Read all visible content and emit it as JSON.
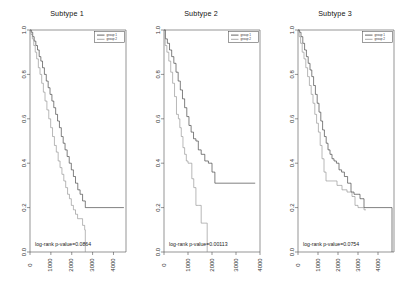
{
  "figure": {
    "background": "#ffffff",
    "panel_count": 3
  },
  "axes": {
    "x_ticks": [
      "0",
      "1000",
      "2000",
      "3000",
      "4000"
    ],
    "x_tick_values": [
      0,
      1000,
      2000,
      3000,
      4000
    ],
    "y_ticks": [
      "0.0",
      "0.2",
      "0.4",
      "0.6",
      "0.8",
      "1.0"
    ],
    "y_tick_values": [
      0.0,
      0.2,
      0.4,
      0.6,
      0.8,
      1.0
    ],
    "xlabel": "",
    "ylabel": ""
  },
  "legend": {
    "position": "top-right",
    "entries": [
      {
        "label": "group 1",
        "color": "#333333"
      },
      {
        "label": "group 2",
        "color": "#8c8c8c"
      }
    ]
  },
  "panels": [
    {
      "title": "Subtype 1",
      "pvalue_text": "log-rank p-value=0.0864",
      "xlim": [
        0,
        4600
      ],
      "ylim": [
        0,
        1
      ]
    },
    {
      "title": "Subtype 2",
      "pvalue_text": "log-rank p-value=0.00113",
      "xlim": [
        0,
        4000
      ],
      "ylim": [
        0,
        1
      ]
    },
    {
      "title": "Subtype 3",
      "pvalue_text": "log-rank p-value=0.0754",
      "xlim": [
        0,
        4800
      ],
      "ylim": [
        0,
        1
      ]
    }
  ],
  "chart_data": [
    {
      "type": "line",
      "title": "Subtype 1",
      "subtitle": "",
      "xlabel": "",
      "ylabel": "",
      "xlim": [
        0,
        4600
      ],
      "ylim": [
        0,
        1
      ],
      "grid": false,
      "legend_position": "top-right",
      "step_style": "post",
      "annotations": [
        "log-rank p-value=0.0864"
      ],
      "series": [
        {
          "name": "group 1",
          "color": "#333333",
          "x": [
            0,
            60,
            130,
            200,
            280,
            360,
            440,
            520,
            600,
            690,
            780,
            870,
            960,
            1050,
            1140,
            1230,
            1320,
            1410,
            1500,
            1590,
            1680,
            1780,
            1880,
            1980,
            2080,
            2180,
            2290,
            2400,
            2520,
            2650,
            4500
          ],
          "y": [
            1.0,
            0.99,
            0.97,
            0.95,
            0.93,
            0.91,
            0.88,
            0.86,
            0.83,
            0.8,
            0.77,
            0.74,
            0.71,
            0.68,
            0.65,
            0.62,
            0.59,
            0.56,
            0.52,
            0.49,
            0.46,
            0.43,
            0.4,
            0.37,
            0.34,
            0.31,
            0.28,
            0.26,
            0.23,
            0.2,
            0.2
          ]
        },
        {
          "name": "group 2",
          "color": "#8c8c8c",
          "x": [
            0,
            50,
            110,
            180,
            250,
            320,
            400,
            480,
            560,
            640,
            720,
            810,
            900,
            990,
            1080,
            1170,
            1260,
            1350,
            1440,
            1530,
            1620,
            1710,
            1800,
            1890,
            1980,
            2080,
            2180,
            2280,
            2400,
            2520,
            2620,
            2650
          ],
          "y": [
            1.0,
            0.98,
            0.96,
            0.93,
            0.9,
            0.87,
            0.83,
            0.8,
            0.76,
            0.72,
            0.68,
            0.64,
            0.6,
            0.56,
            0.52,
            0.48,
            0.45,
            0.41,
            0.38,
            0.35,
            0.32,
            0.29,
            0.26,
            0.24,
            0.21,
            0.19,
            0.17,
            0.15,
            0.15,
            0.12,
            0.1,
            0.0
          ]
        }
      ]
    },
    {
      "type": "line",
      "title": "Subtype 2",
      "subtitle": "",
      "xlabel": "",
      "ylabel": "",
      "xlim": [
        0,
        4000
      ],
      "ylim": [
        0,
        1
      ],
      "grid": false,
      "legend_position": "top-right",
      "step_style": "post",
      "annotations": [
        "log-rank p-value=0.00113"
      ],
      "series": [
        {
          "name": "group 1",
          "color": "#333333",
          "x": [
            0,
            60,
            140,
            230,
            320,
            410,
            500,
            590,
            680,
            770,
            860,
            950,
            1040,
            1130,
            1230,
            1330,
            1430,
            1550,
            1700,
            1850,
            2000,
            2120,
            3800
          ],
          "y": [
            1.0,
            0.96,
            0.94,
            0.91,
            0.88,
            0.85,
            0.81,
            0.77,
            0.73,
            0.69,
            0.65,
            0.61,
            0.57,
            0.54,
            0.51,
            0.5,
            0.46,
            0.44,
            0.41,
            0.4,
            0.36,
            0.31,
            0.31
          ]
        },
        {
          "name": "group 2",
          "color": "#8c8c8c",
          "x": [
            0,
            50,
            120,
            200,
            280,
            360,
            440,
            520,
            600,
            660,
            720,
            790,
            860,
            930,
            1000,
            1080,
            1160,
            1240,
            1330,
            1430,
            1550,
            1700,
            1760,
            1800
          ],
          "y": [
            1.0,
            0.93,
            0.9,
            0.86,
            0.81,
            0.76,
            0.7,
            0.62,
            0.6,
            0.56,
            0.52,
            0.47,
            0.44,
            0.41,
            0.4,
            0.4,
            0.33,
            0.29,
            0.21,
            0.21,
            0.13,
            0.13,
            0.13,
            0.0
          ]
        }
      ]
    },
    {
      "type": "line",
      "title": "Subtype 3",
      "subtitle": "",
      "xlabel": "",
      "ylabel": "",
      "xlim": [
        0,
        4800
      ],
      "ylim": [
        0,
        1
      ],
      "grid": false,
      "legend_position": "top-right",
      "step_style": "post",
      "annotations": [
        "log-rank p-value=0.0754"
      ],
      "series": [
        {
          "name": "group 1",
          "color": "#333333",
          "x": [
            0,
            70,
            150,
            240,
            330,
            420,
            510,
            600,
            690,
            780,
            870,
            960,
            1050,
            1140,
            1230,
            1320,
            1410,
            1500,
            1600,
            1700,
            1800,
            1920,
            2050,
            2180,
            2320,
            2480,
            2650,
            2800,
            2950,
            3100,
            3300,
            3350,
            4700
          ],
          "y": [
            1.0,
            0.99,
            0.97,
            0.94,
            0.91,
            0.88,
            0.85,
            0.82,
            0.79,
            0.75,
            0.71,
            0.67,
            0.63,
            0.59,
            0.55,
            0.52,
            0.49,
            0.46,
            0.44,
            0.42,
            0.41,
            0.4,
            0.37,
            0.36,
            0.34,
            0.31,
            0.27,
            0.26,
            0.26,
            0.24,
            0.2,
            0.2,
            0.0
          ]
        },
        {
          "name": "group 2",
          "color": "#8c8c8c",
          "x": [
            0,
            60,
            130,
            210,
            300,
            390,
            480,
            570,
            660,
            750,
            840,
            930,
            1020,
            1110,
            1200,
            1300,
            1400,
            1450,
            1700,
            1950,
            2200,
            2450,
            2700,
            2850,
            3000,
            3150,
            3300,
            3400
          ],
          "y": [
            1.0,
            0.97,
            0.94,
            0.9,
            0.87,
            0.83,
            0.79,
            0.75,
            0.71,
            0.67,
            0.62,
            0.58,
            0.54,
            0.48,
            0.42,
            0.36,
            0.32,
            0.32,
            0.32,
            0.3,
            0.28,
            0.27,
            0.25,
            0.21,
            0.2,
            0.2,
            0.19,
            0.19
          ]
        }
      ]
    }
  ]
}
